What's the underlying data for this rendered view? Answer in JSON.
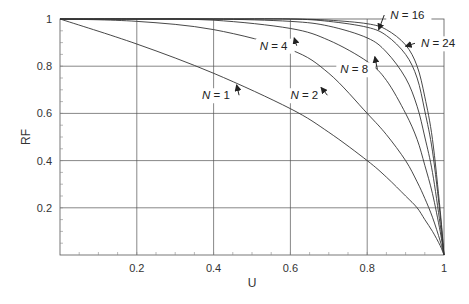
{
  "chart_data": {
    "type": "line",
    "title": "",
    "xlabel": "U",
    "ylabel": "RF",
    "xlim": [
      0,
      1
    ],
    "ylim": [
      0,
      1
    ],
    "grid": true,
    "legend_position": "inline-annotations",
    "x_ticks": [
      0.2,
      0.4,
      0.6,
      0.8,
      1
    ],
    "x_tick_labels": [
      "0.2",
      "0.4",
      "0.6",
      "0.8",
      "1"
    ],
    "y_ticks": [
      0.2,
      0.4,
      0.6,
      0.8,
      1
    ],
    "y_tick_labels": [
      "0.2",
      "0.4",
      "0.6",
      "0.8",
      "1"
    ],
    "x": [
      0,
      0.2,
      0.4,
      0.6,
      0.7,
      0.8,
      0.85,
      0.9,
      0.93,
      0.95,
      0.97,
      0.99,
      1
    ],
    "series": [
      {
        "name": "N = 1",
        "values": [
          1,
          0.894,
          0.77,
          0.62,
          0.52,
          0.4,
          0.33,
          0.25,
          0.2,
          0.15,
          0.1,
          0.04,
          0
        ]
      },
      {
        "name": "N = 2",
        "values": [
          1,
          0.99,
          0.955,
          0.87,
          0.77,
          0.6,
          0.51,
          0.4,
          0.31,
          0.24,
          0.16,
          0.06,
          0
        ]
      },
      {
        "name": "N = 4",
        "values": [
          1,
          1,
          0.995,
          0.96,
          0.91,
          0.82,
          0.74,
          0.6,
          0.49,
          0.38,
          0.26,
          0.1,
          0
        ]
      },
      {
        "name": "N = 8",
        "values": [
          1,
          1,
          1,
          0.99,
          0.97,
          0.92,
          0.86,
          0.75,
          0.63,
          0.5,
          0.35,
          0.13,
          0
        ]
      },
      {
        "name": "N = 16",
        "values": [
          1,
          1,
          1,
          1,
          0.99,
          0.965,
          0.93,
          0.85,
          0.75,
          0.61,
          0.44,
          0.17,
          0
        ]
      },
      {
        "name": "N = 24",
        "values": [
          1,
          1,
          1,
          1,
          0.995,
          0.98,
          0.955,
          0.89,
          0.8,
          0.67,
          0.49,
          0.19,
          0
        ]
      }
    ],
    "annotations": [
      {
        "text": "N = 1",
        "label_xy": [
          0.37,
          0.66
        ],
        "arrow_to": [
          0.46,
          0.72
        ]
      },
      {
        "text": "N = 2",
        "label_xy": [
          0.6,
          0.66
        ],
        "arrow_to": [
          0.68,
          0.71
        ]
      },
      {
        "text": "N = 4",
        "label_xy": [
          0.52,
          0.87
        ],
        "arrow_to": [
          0.61,
          0.92
        ]
      },
      {
        "text": "N = 8",
        "label_xy": [
          0.73,
          0.77
        ],
        "arrow_to": [
          0.82,
          0.84
        ]
      },
      {
        "text": "N = 16",
        "label_xy": [
          0.86,
          1.0
        ],
        "arrow_to": [
          0.83,
          0.955
        ]
      },
      {
        "text": "N = 24",
        "label_xy": [
          0.94,
          0.88
        ],
        "arrow_to": [
          0.9,
          0.885
        ]
      }
    ]
  },
  "colors": {
    "line": "#333333",
    "grid": "#555555",
    "text": "#333333",
    "background": "#ffffff"
  }
}
